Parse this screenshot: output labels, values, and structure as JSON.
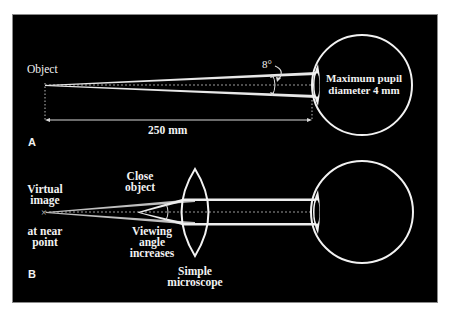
{
  "figure": {
    "background": "#000000",
    "stroke": "#f0f0f0",
    "panels": [
      {
        "id": "A",
        "label": "A",
        "labels": {
          "object": "Object",
          "angle": "8°",
          "pupil": "Maximum pupil\ndiameter 4 mm",
          "distance": "250 mm"
        }
      },
      {
        "id": "B",
        "label": "B",
        "labels": {
          "virtual_image": "Virtual\nimage",
          "near_point": "at near\npoint",
          "close_object": "Close\nobject",
          "viewing_angle": "Viewing\nangle\nincreases",
          "microscope": "Simple\nmicroscope"
        }
      }
    ]
  }
}
